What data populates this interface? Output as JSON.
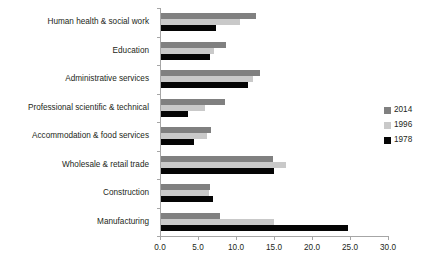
{
  "chart_data": {
    "type": "bar",
    "orientation": "horizontal",
    "title": "",
    "subtitle": "",
    "xlabel": "",
    "ylabel": "",
    "xlim": [
      0.0,
      30.0
    ],
    "xticks": [
      0.0,
      5.0,
      10.0,
      15.0,
      20.0,
      25.0,
      30.0
    ],
    "xtick_labels": [
      "0.0",
      "5.0",
      "10.0",
      "15.0",
      "20.0",
      "25.0",
      "30.0"
    ],
    "grid": false,
    "legend_position": "right",
    "categories": [
      "Human health & social work",
      "Education",
      "Administrative services",
      "Professional scientific & technical",
      "Accommodation & food services",
      "Wholesale & retail trade",
      "Construction",
      "Manufacturing"
    ],
    "series": [
      {
        "name": "2014",
        "color": "#808080",
        "values": [
          12.5,
          8.6,
          13.0,
          8.4,
          6.6,
          14.8,
          6.4,
          7.8
        ]
      },
      {
        "name": "1996",
        "color": "#c9c9c9",
        "values": [
          10.4,
          7.0,
          12.1,
          5.8,
          6.0,
          16.5,
          6.3,
          14.9
        ]
      },
      {
        "name": "1978",
        "color": "#050505",
        "values": [
          7.2,
          6.4,
          11.4,
          3.6,
          4.4,
          14.9,
          6.9,
          24.6
        ]
      }
    ]
  },
  "legend": {
    "items": [
      {
        "label": "2014",
        "color": "#808080"
      },
      {
        "label": "1996",
        "color": "#c9c9c9"
      },
      {
        "label": "1978",
        "color": "#050505"
      }
    ]
  },
  "axis_color": "#a6a6a6",
  "text_color": "#231f20",
  "background": "#ffffff"
}
